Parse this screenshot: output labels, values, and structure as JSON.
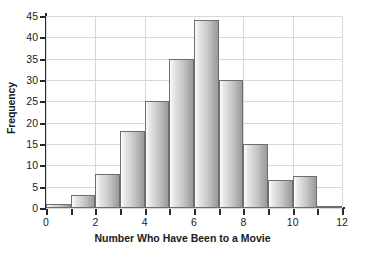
{
  "chart_data": {
    "type": "bar",
    "title": "",
    "xlabel": "Number Who Have Been to a Movie",
    "ylabel": "Frequency",
    "categories": [
      "0",
      "1",
      "2",
      "3",
      "4",
      "5",
      "6",
      "7",
      "8",
      "9",
      "10",
      "11"
    ],
    "values": [
      1,
      3,
      8,
      18,
      25,
      35,
      44,
      30,
      15,
      6.5,
      7.5,
      0.5
    ],
    "bin_edges": [
      0,
      1,
      2,
      3,
      4,
      5,
      6,
      7,
      8,
      9,
      10,
      11,
      12
    ],
    "xlim": [
      0,
      12
    ],
    "ylim": [
      0,
      45
    ],
    "x_ticks": [
      "0",
      "2",
      "4",
      "6",
      "8",
      "10",
      "12"
    ],
    "x_tick_values": [
      0,
      2,
      4,
      6,
      8,
      10,
      12
    ],
    "y_ticks": [
      "0",
      "5",
      "10",
      "15",
      "20",
      "25",
      "30",
      "35",
      "40",
      "45"
    ],
    "y_tick_values": [
      0,
      5,
      10,
      15,
      20,
      25,
      30,
      35,
      40,
      45
    ],
    "grid": true,
    "legend": false,
    "bar_fill_light": "#fcfcfc",
    "bar_fill_dark": "#9a9a9a",
    "bar_edge_color": "#6e6e6e",
    "grid_color": "#d8d8d8",
    "axis_color": "#2a2a2a",
    "background_color": "#ffffff"
  }
}
